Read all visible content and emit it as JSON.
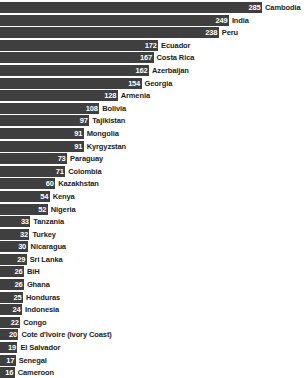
{
  "chart_data": {
    "type": "bar",
    "orientation": "horizontal",
    "title": "",
    "subtitle": "",
    "xlabel": "",
    "ylabel": "",
    "grid": false,
    "legend": false,
    "xlim": [
      0,
      285
    ],
    "value_label_position": "inside-end",
    "category_label_position": "outside-end",
    "bar_color": "#3f3f3f",
    "value_text_color": "#ffffff",
    "category_text_color": "#1a1a1a",
    "background_color": "#ffffff",
    "sort": "descending",
    "categories": [
      "Cambodia",
      "India",
      "Peru",
      "Ecuador",
      "Costa Rica",
      "Azerbaijan",
      "Georgia",
      "Armenia",
      "Bolivia",
      "Tajikistan",
      "Mongolia",
      "Kyrgyzstan",
      "Paraguay",
      "Colombia",
      "Kazakhstan",
      "Kenya",
      "Nigeria",
      "Tanzania",
      "Turkey",
      "Nicaragua",
      "Sri Lanka",
      "BiH",
      "Ghana",
      "Honduras",
      "Indonesia",
      "Congo",
      "Cote d'Ivoire (Ivory Coast)",
      "El Salvador",
      "Senegal",
      "Cameroon"
    ],
    "values": [
      285,
      249,
      238,
      172,
      167,
      162,
      154,
      128,
      108,
      97,
      91,
      91,
      73,
      71,
      60,
      54,
      52,
      33,
      32,
      30,
      29,
      26,
      26,
      25,
      24,
      22,
      20,
      19,
      17,
      16
    ]
  }
}
